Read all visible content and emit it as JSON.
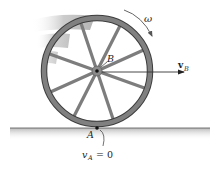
{
  "figure": {
    "labels": {
      "omega": "ω",
      "point_b": "B",
      "velocity_b": "v",
      "velocity_b_sub": "B",
      "point_a": "A",
      "velocity_a": "v",
      "velocity_a_sub": "A",
      "velocity_a_eq": "= 0"
    },
    "spokes": 8,
    "colors": {
      "rim": "#7a7a7a",
      "rim_edge": "#3a3a3a",
      "spoke": "#808080",
      "ground_shadow": "#c8c8c8",
      "motion_blur": "#b5b5b5",
      "arrow": "#333333"
    }
  }
}
